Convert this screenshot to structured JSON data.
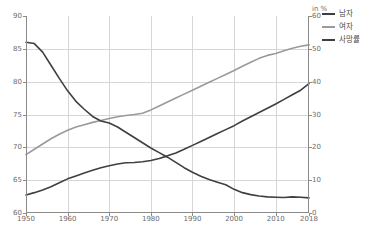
{
  "chart_data": {
    "type": "line",
    "title": "",
    "subtitle": "",
    "xlabel": "",
    "ylabel": "",
    "ylabel_right": "in %",
    "xlim": [
      1950,
      2018
    ],
    "ylim": [
      60,
      90
    ],
    "ylim_right": [
      0,
      60
    ],
    "grid": true,
    "legend_position": "top-right",
    "x_ticks": [
      "1950",
      "1960",
      "1970",
      "1980",
      "1990",
      "2000",
      "2010",
      "2018"
    ],
    "x_tick_values": [
      1950,
      1960,
      1970,
      1980,
      1990,
      2000,
      2010,
      2018
    ],
    "y_ticks_left": [
      "60",
      "65",
      "70",
      "75",
      "80",
      "85",
      "90"
    ],
    "y_tick_values_left": [
      60,
      65,
      70,
      75,
      80,
      85,
      90
    ],
    "y_ticks_right": [
      "0",
      "10",
      "20",
      "30",
      "40",
      "50",
      "60"
    ],
    "y_tick_values_right": [
      0,
      10,
      20,
      30,
      40,
      50,
      60
    ],
    "series": [
      {
        "name": "남자",
        "axis": "right",
        "color": "#3f3f3f",
        "x": [
          1950,
          1952,
          1954,
          1956,
          1958,
          1960,
          1962,
          1964,
          1966,
          1968,
          1970,
          1972,
          1974,
          1976,
          1978,
          1980,
          1982,
          1984,
          1986,
          1988,
          1990,
          1992,
          1994,
          1996,
          1998,
          2000,
          2002,
          2004,
          2006,
          2008,
          2010,
          2012,
          2014,
          2016,
          2018
        ],
        "values": [
          5.5,
          6.2,
          7.0,
          8.0,
          9.2,
          10.4,
          11.3,
          12.2,
          13.0,
          13.8,
          14.4,
          14.9,
          15.3,
          15.4,
          15.6,
          16.0,
          16.6,
          17.4,
          18.3,
          19.4,
          20.6,
          21.8,
          23.0,
          24.2,
          25.4,
          26.6,
          28.0,
          29.3,
          30.6,
          31.9,
          33.2,
          34.6,
          36.0,
          37.4,
          39.4
        ]
      },
      {
        "name": "여자",
        "axis": "right",
        "color": "#9a9a9a",
        "x": [
          1950,
          1952,
          1954,
          1956,
          1958,
          1960,
          1962,
          1964,
          1966,
          1968,
          1970,
          1972,
          1974,
          1976,
          1978,
          1980,
          1982,
          1984,
          1986,
          1988,
          1990,
          1992,
          1994,
          1996,
          1998,
          2000,
          2002,
          2004,
          2006,
          2008,
          2010,
          2012,
          2014,
          2016,
          2018
        ],
        "values": [
          17.8,
          19.4,
          21.0,
          22.6,
          24.0,
          25.2,
          26.2,
          26.9,
          27.6,
          28.2,
          28.8,
          29.3,
          29.7,
          30.0,
          30.4,
          31.4,
          32.6,
          33.8,
          35.0,
          36.2,
          37.4,
          38.6,
          39.8,
          41.0,
          42.2,
          43.4,
          44.7,
          45.9,
          47.1,
          48.0,
          48.6,
          49.4,
          50.2,
          50.8,
          51.2
        ]
      },
      {
        "name": "사망률",
        "axis": "right",
        "color": "#3f3f3f",
        "x": [
          1950,
          1952,
          1954,
          1956,
          1958,
          1960,
          1962,
          1964,
          1966,
          1968,
          1970,
          1972,
          1974,
          1976,
          1978,
          1980,
          1982,
          1984,
          1986,
          1988,
          1990,
          1992,
          1994,
          1996,
          1998,
          2000,
          2002,
          2004,
          2006,
          2008,
          2010,
          2012,
          2014,
          2016,
          2018
        ],
        "values": [
          52.0,
          51.6,
          49.0,
          45.0,
          41.0,
          37.2,
          34.0,
          31.6,
          29.4,
          28.0,
          27.4,
          26.2,
          24.6,
          23.0,
          21.4,
          19.8,
          18.4,
          17.0,
          15.4,
          13.8,
          12.4,
          11.2,
          10.2,
          9.4,
          8.6,
          7.2,
          6.2,
          5.6,
          5.2,
          4.9,
          4.8,
          4.7,
          4.9,
          4.8,
          4.6
        ]
      }
    ],
    "legend": [
      {
        "label": "남자",
        "color": "#3f3f3f"
      },
      {
        "label": "여자",
        "color": "#9a9a9a"
      },
      {
        "label": "사망률",
        "color": "#3f3f3f"
      }
    ],
    "caption": ""
  }
}
